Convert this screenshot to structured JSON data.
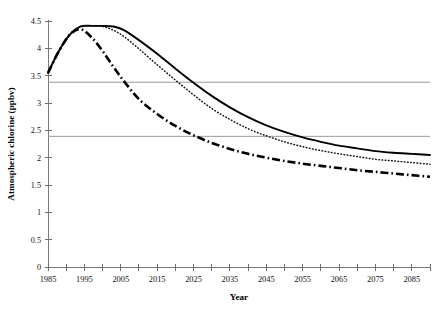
{
  "chart_data": {
    "type": "line",
    "title": "",
    "xlabel": "Year",
    "ylabel": "Atmospheric chlorine (ppbv)",
    "xlim": [
      1985,
      2090
    ],
    "ylim": [
      0,
      4.5
    ],
    "grid": false,
    "legend": "none",
    "x_tick_labels": [
      "1985",
      "1995",
      "2005",
      "2015",
      "2025",
      "2035",
      "2045",
      "2055",
      "2065",
      "2075",
      "2085"
    ],
    "x_tick_values": [
      1985,
      1995,
      2005,
      2015,
      2025,
      2035,
      2045,
      2055,
      2065,
      2075,
      2085
    ],
    "x_minor_tick_values": [
      1990,
      2000,
      2010,
      2020,
      2030,
      2040,
      2050,
      2060,
      2070,
      2080,
      2090
    ],
    "y_tick_labels": [
      "0",
      "0.5",
      "1",
      "1.5",
      "2",
      "2.5",
      "3",
      "3.5",
      "4",
      "4.5"
    ],
    "y_tick_values": [
      0,
      0.5,
      1,
      1.5,
      2,
      2.5,
      3,
      3.5,
      4,
      4.5
    ],
    "x": [
      1985,
      1988,
      1991,
      1994,
      1997,
      2000,
      2003,
      2006,
      2010,
      2015,
      2020,
      2025,
      2030,
      2035,
      2040,
      2045,
      2050,
      2055,
      2060,
      2065,
      2070,
      2075,
      2080,
      2085,
      2090
    ],
    "series": [
      {
        "name": "upper-scenario",
        "style": "solid",
        "color": "#000000",
        "values": [
          3.55,
          3.95,
          4.25,
          4.4,
          4.41,
          4.41,
          4.4,
          4.33,
          4.15,
          3.9,
          3.63,
          3.37,
          3.13,
          2.92,
          2.74,
          2.59,
          2.47,
          2.37,
          2.29,
          2.22,
          2.17,
          2.12,
          2.09,
          2.07,
          2.05
        ]
      },
      {
        "name": "middle-scenario",
        "style": "dotted",
        "color": "#111111",
        "values": [
          3.55,
          3.95,
          4.25,
          4.4,
          4.41,
          4.4,
          4.33,
          4.21,
          3.99,
          3.7,
          3.42,
          3.15,
          2.9,
          2.7,
          2.53,
          2.4,
          2.29,
          2.2,
          2.13,
          2.07,
          2.02,
          1.97,
          1.94,
          1.91,
          1.88
        ]
      },
      {
        "name": "lower-scenario",
        "style": "dash-dot",
        "color": "#000000",
        "values": [
          3.55,
          3.95,
          4.25,
          4.35,
          4.2,
          3.95,
          3.66,
          3.39,
          3.07,
          2.8,
          2.58,
          2.41,
          2.27,
          2.16,
          2.07,
          2.0,
          1.94,
          1.89,
          1.85,
          1.81,
          1.77,
          1.74,
          1.71,
          1.68,
          1.65
        ]
      }
    ],
    "reference_lines": [
      {
        "name": "upper-reference-line",
        "value": 3.38,
        "color": "#9a9a9a"
      },
      {
        "name": "lower-reference-line",
        "value": 2.39,
        "color": "#9a9a9a"
      }
    ]
  }
}
